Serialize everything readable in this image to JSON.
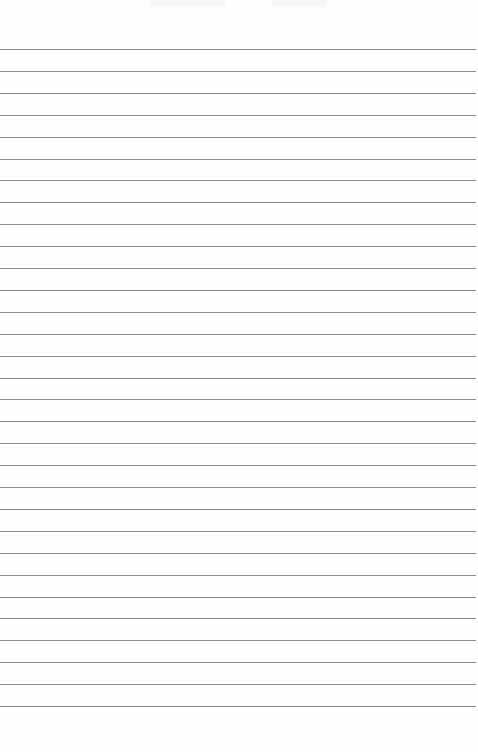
{
  "paper": {
    "type": "lined-paper",
    "background": "#fefefe",
    "line_color": "#8e8e8e",
    "first_line_y": 49,
    "line_spacing": 21.9,
    "line_count": 31,
    "header_text_blurred": [
      "",
      ""
    ]
  }
}
